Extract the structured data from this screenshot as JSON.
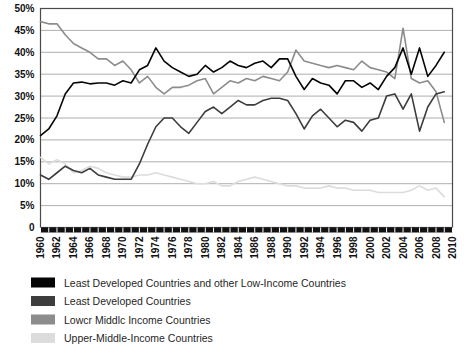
{
  "chart_data": {
    "type": "line",
    "title": "",
    "xlabel": "",
    "ylabel": "",
    "ylim": [
      0,
      50
    ],
    "xlim": [
      1960,
      2010
    ],
    "grid": true,
    "legend_position": "bottom-left",
    "ytick_labels": [
      "0",
      "5%",
      "10%",
      "15%",
      "20%",
      "25%",
      "30%",
      "35%",
      "40%",
      "45%",
      "50%"
    ],
    "ytick_values": [
      0,
      5,
      10,
      15,
      20,
      25,
      30,
      35,
      40,
      45,
      50
    ],
    "xtick_labels": [
      "1960",
      "1962",
      "1964",
      "1966",
      "1968",
      "1970",
      "1972",
      "1974",
      "1976",
      "1978",
      "1980",
      "1982",
      "1984",
      "1986",
      "1988",
      "1990",
      "1992",
      "1994",
      "1996",
      "1998",
      "2000",
      "2002",
      "2004",
      "2006",
      "2008",
      "2010"
    ],
    "xtick_values": [
      1960,
      1962,
      1964,
      1966,
      1968,
      1970,
      1972,
      1974,
      1976,
      1978,
      1980,
      1982,
      1984,
      1986,
      1988,
      1990,
      1992,
      1994,
      1996,
      1998,
      2000,
      2002,
      2004,
      2006,
      2008,
      2010
    ],
    "x": [
      1960,
      1961,
      1962,
      1963,
      1964,
      1965,
      1966,
      1967,
      1968,
      1969,
      1970,
      1971,
      1972,
      1973,
      1974,
      1975,
      1976,
      1977,
      1978,
      1979,
      1980,
      1981,
      1982,
      1983,
      1984,
      1985,
      1986,
      1987,
      1988,
      1989,
      1990,
      1991,
      1992,
      1993,
      1994,
      1995,
      1996,
      1997,
      1998,
      1999,
      2000,
      2001,
      2002,
      2003,
      2004,
      2005,
      2006,
      2007,
      2008,
      2009
    ],
    "series": [
      {
        "name": "Least Developed Countries and other Low-Income Countries",
        "color": "#050505",
        "values": [
          21.0,
          22.5,
          25.5,
          30.5,
          33.0,
          33.2,
          32.8,
          33.0,
          33.0,
          32.5,
          33.5,
          33.0,
          36.0,
          37.0,
          41.0,
          38.0,
          36.5,
          35.5,
          34.5,
          35.0,
          37.0,
          35.5,
          36.5,
          38.0,
          37.0,
          36.5,
          37.5,
          38.0,
          36.5,
          38.5,
          38.5,
          34.5,
          31.5,
          34.0,
          33.0,
          32.5,
          30.5,
          33.5,
          33.5,
          32.0,
          33.0,
          31.5,
          34.5,
          36.5,
          41.0,
          35.0,
          41.0,
          34.5,
          37.0,
          40.0
        ]
      },
      {
        "name": "Least Developed Countries",
        "color": "#3d3d3d",
        "values": [
          12.0,
          11.0,
          12.5,
          14.0,
          13.0,
          12.5,
          13.5,
          12.0,
          11.5,
          11.0,
          11.0,
          11.0,
          14.5,
          19.0,
          23.0,
          25.0,
          25.0,
          23.0,
          21.5,
          24.0,
          26.5,
          27.5,
          26.0,
          27.5,
          29.0,
          28.0,
          28.0,
          29.0,
          29.5,
          29.5,
          29.0,
          26.0,
          22.5,
          25.5,
          27.0,
          25.0,
          23.0,
          24.5,
          24.0,
          22.0,
          24.5,
          25.0,
          30.0,
          30.5,
          27.0,
          30.5,
          22.0,
          27.5,
          30.5,
          31.0
        ]
      },
      {
        "name": "Lower Middle Income Countries",
        "color": "#8c8c8c",
        "values": [
          47.0,
          46.5,
          46.5,
          44.0,
          42.0,
          41.0,
          40.0,
          38.5,
          38.5,
          37.0,
          38.0,
          36.0,
          33.0,
          34.5,
          32.0,
          30.5,
          32.0,
          32.0,
          32.5,
          33.5,
          34.0,
          30.5,
          32.0,
          33.5,
          33.0,
          34.0,
          33.5,
          34.5,
          34.0,
          33.5,
          35.5,
          40.5,
          38.0,
          37.5,
          37.0,
          36.5,
          37.0,
          36.5,
          36.0,
          38.0,
          36.5,
          36.0,
          35.5,
          34.0,
          45.5,
          34.0,
          33.0,
          33.5,
          31.0,
          24.0
        ]
      },
      {
        "name": "Upper-Middle-Income Countries",
        "color": "#dcdcdc",
        "values": [
          16.0,
          14.5,
          15.5,
          14.5,
          12.5,
          13.0,
          14.0,
          13.5,
          12.5,
          12.0,
          11.5,
          11.5,
          12.0,
          12.0,
          12.5,
          12.0,
          11.5,
          11.0,
          10.5,
          10.0,
          10.0,
          10.5,
          9.5,
          9.5,
          10.5,
          11.0,
          11.5,
          11.0,
          10.5,
          10.0,
          9.5,
          9.5,
          9.0,
          9.0,
          9.0,
          9.5,
          9.0,
          9.0,
          8.5,
          8.5,
          8.5,
          8.0,
          8.0,
          8.0,
          8.0,
          8.5,
          9.5,
          8.5,
          9.0,
          7.0
        ]
      }
    ]
  },
  "legend": {
    "items": [
      {
        "label": "Least Developed Countries and other Low-Income Countries",
        "color": "#050505"
      },
      {
        "label": "Least Developed Countries",
        "color": "#3d3d3d"
      },
      {
        "label": "Lowcr Middlc Income Countries",
        "color": "#8c8c8c"
      },
      {
        "label": "Upper-Middle-Income Countries",
        "color": "#dcdcdc"
      }
    ]
  }
}
